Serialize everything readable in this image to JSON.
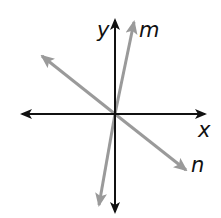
{
  "diagram": {
    "type": "coordinate-plane-lines",
    "colors": {
      "axis": "#111111",
      "line": "#9a9a9a",
      "background": "#ffffff"
    },
    "axes": {
      "x_label": "x",
      "y_label": "y"
    },
    "lines": [
      {
        "id": "m",
        "label": "m"
      },
      {
        "id": "n",
        "label": "n"
      }
    ]
  }
}
